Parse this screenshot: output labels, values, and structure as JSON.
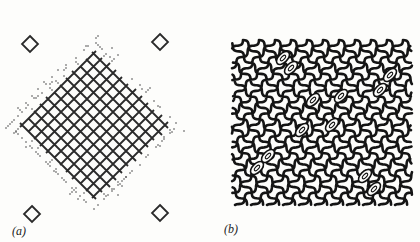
{
  "figure": {
    "panels": [
      {
        "id": "a",
        "label": "(a)",
        "description": "Diamond-shaped crossed lattice with dotted fringe and four isolated small diamonds near corners",
        "lattice": {
          "cx": 95,
          "cy": 125,
          "half_diag": 95,
          "cell": 13,
          "stroke": "#2a2a2a"
        },
        "isolated_diamonds": [
          [
            30,
            44
          ],
          [
            160,
            42
          ],
          [
            32,
            214
          ],
          [
            160,
            213
          ]
        ]
      },
      {
        "id": "b",
        "label": "(b)",
        "description": "Square wavy lattice with oval defects",
        "lattice": {
          "x0": 22,
          "y0": 40,
          "x1": 202,
          "y1": 205,
          "cell": 16,
          "stroke": "#151515"
        },
        "ovals": [
          [
            73,
            58
          ],
          [
            81,
            68
          ],
          [
            180,
            75
          ],
          [
            170,
            90
          ],
          [
            103,
            100
          ],
          [
            131,
            96
          ],
          [
            122,
            125
          ],
          [
            92,
            130
          ],
          [
            58,
            156
          ],
          [
            47,
            168
          ],
          [
            155,
            176
          ],
          [
            164,
            189
          ]
        ]
      }
    ]
  }
}
